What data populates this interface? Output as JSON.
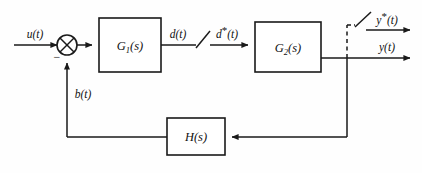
{
  "diagram": {
    "stroke_color": "#1a1a1a",
    "background_color": "#fefefe",
    "blocks": [
      {
        "id": "g1",
        "label_main": "G",
        "label_sub": "1",
        "label_tail": "(s)",
        "x": 99,
        "y": 18,
        "w": 62,
        "h": 54
      },
      {
        "id": "g2",
        "label_main": "G",
        "label_sub": "2",
        "label_tail": "(s)",
        "x": 255,
        "y": 22,
        "w": 66,
        "h": 50
      },
      {
        "id": "h",
        "label_main": "H",
        "label_sub": "",
        "label_tail": "(s)",
        "x": 167,
        "y": 118,
        "w": 58,
        "h": 37
      }
    ],
    "signals": {
      "input": "u(t)",
      "error_sign": "−",
      "feedback": "b(t)",
      "g1_output": "d(t)",
      "sampled_d": "d*(t)",
      "sampled_y": "y*(t)",
      "output": "y(t)"
    },
    "label_parts": {
      "u": {
        "base": "u",
        "paren": "(t)"
      },
      "b": {
        "base": "b",
        "paren": "(t)"
      },
      "d": {
        "base": "d",
        "paren": "(t)"
      },
      "d_star": {
        "base": "d",
        "star": "*",
        "paren": "(t)"
      },
      "y_star": {
        "base": "y",
        "star": "*",
        "paren": "(t)"
      },
      "y": {
        "base": "y",
        "paren": "(t)"
      }
    },
    "elements": {
      "summing_junction": "summing-junction-cross-circle",
      "sampler_d": "sampler-switch-d",
      "sampler_y": "sampler-switch-y",
      "dashed_tap": "dashed-tap-line"
    }
  }
}
